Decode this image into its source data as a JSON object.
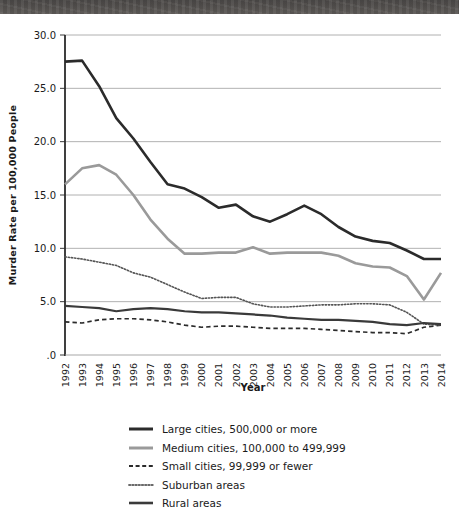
{
  "page": {
    "top_band": "scan-artifact-band"
  },
  "chart_data": {
    "type": "line",
    "title": "",
    "xlabel": "Year",
    "ylabel": "Murder Rate per 100,000 People",
    "xlim": [
      1992,
      2014
    ],
    "ylim": [
      0,
      30
    ],
    "ytick_labels": [
      "30.0",
      "25.0",
      "20.0",
      "15.0",
      "10.0",
      "5.0",
      ".0"
    ],
    "ytick_values": [
      30,
      25,
      20,
      15,
      10,
      5,
      0
    ],
    "grid": "horizontal",
    "legend_position": "below",
    "categories": [
      "1992",
      "1993",
      "1994",
      "1995",
      "1996",
      "1997",
      "1998",
      "1999",
      "2000",
      "2001",
      "2002",
      "2003",
      "2004",
      "2005",
      "2006",
      "2007",
      "2008",
      "2009",
      "2010",
      "2011",
      "2012",
      "2013",
      "2014"
    ],
    "series": [
      {
        "name": "Large cities, 500,000 or more",
        "style": "solid",
        "color": "#2b2b2b",
        "width": 2.6,
        "values": [
          27.5,
          27.6,
          25.2,
          22.2,
          20.3,
          18.1,
          16.0,
          15.6,
          14.8,
          13.8,
          14.1,
          13.0,
          12.5,
          13.2,
          14.0,
          13.2,
          12.0,
          11.1,
          10.7,
          10.5,
          9.8,
          9.0,
          9.0
        ]
      },
      {
        "name": "Medium cities, 100,000 to 499,999",
        "style": "solid",
        "color": "#9a9a9a",
        "width": 2.6,
        "values": [
          16.0,
          17.5,
          17.8,
          16.9,
          15.0,
          12.7,
          10.9,
          9.5,
          9.5,
          9.6,
          9.6,
          10.1,
          9.5,
          9.6,
          9.6,
          9.6,
          9.3,
          8.6,
          8.3,
          8.2,
          7.4,
          5.2,
          7.7
        ]
      },
      {
        "name": "Small cities, 99,999 or fewer",
        "style": "dashed",
        "color": "#2b2b2b",
        "width": 1.7,
        "values": [
          3.1,
          3.0,
          3.3,
          3.4,
          3.4,
          3.3,
          3.1,
          2.8,
          2.6,
          2.7,
          2.7,
          2.6,
          2.5,
          2.5,
          2.5,
          2.4,
          2.3,
          2.2,
          2.1,
          2.1,
          2.0,
          2.6,
          2.8
        ]
      },
      {
        "name": "Suburban areas",
        "style": "dotted",
        "color": "#555555",
        "width": 1.6,
        "values": [
          9.2,
          9.0,
          8.7,
          8.4,
          7.7,
          7.3,
          6.6,
          5.9,
          5.3,
          5.4,
          5.4,
          4.8,
          4.5,
          4.5,
          4.6,
          4.7,
          4.7,
          4.8,
          4.8,
          4.7,
          4.0,
          2.9,
          2.8
        ]
      },
      {
        "name": "Rural areas",
        "style": "solid",
        "color": "#3a3a3a",
        "width": 2.2,
        "values": [
          4.6,
          4.5,
          4.4,
          4.1,
          4.3,
          4.4,
          4.3,
          4.1,
          4.0,
          4.0,
          3.9,
          3.8,
          3.7,
          3.5,
          3.4,
          3.3,
          3.3,
          3.2,
          3.1,
          2.9,
          2.8,
          3.0,
          2.9
        ]
      }
    ]
  },
  "legend": {
    "items": [
      {
        "label": "Large cities, 500,000 or more",
        "style": "solid",
        "color": "#2b2b2b",
        "width": 3
      },
      {
        "label": "Medium cities, 100,000 to 499,999",
        "style": "solid",
        "color": "#9a9a9a",
        "width": 3
      },
      {
        "label": "Small cities, 99,999 or fewer",
        "style": "dashed",
        "color": "#2b2b2b",
        "width": 1.8
      },
      {
        "label": "Suburban areas",
        "style": "dotted",
        "color": "#6a6a6a",
        "width": 1.8
      },
      {
        "label": "Rural areas",
        "style": "solid",
        "color": "#3a3a3a",
        "width": 2.6
      }
    ]
  }
}
